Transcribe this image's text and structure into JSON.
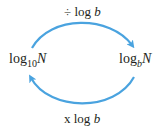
{
  "diagram": {
    "top_arrow": {
      "op": "÷",
      "text": "log",
      "var": "b"
    },
    "bottom_arrow": {
      "op": "x",
      "text": "log",
      "var": "b"
    },
    "left_node": {
      "base": "log",
      "sub": "10",
      "var": "N"
    },
    "right_node": {
      "base": "log",
      "sub": "b",
      "var": "N"
    },
    "arrow_color": "#4aa3df"
  }
}
